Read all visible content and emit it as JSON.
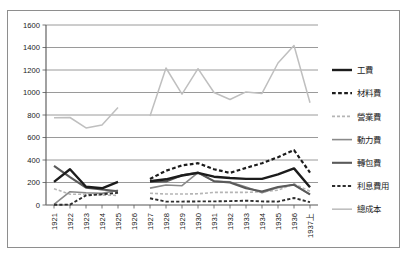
{
  "chart_data": {
    "type": "line",
    "title": "",
    "xlabel": "",
    "ylabel": "",
    "ylim": [
      0,
      1600
    ],
    "ytick_step": 200,
    "yticks": [
      0,
      200,
      400,
      600,
      800,
      1000,
      1200,
      1400,
      1600
    ],
    "grid": true,
    "legend_position": "right",
    "categories": [
      "1921",
      "1922",
      "1923",
      "1924",
      "1925",
      "1926",
      "1927",
      "1928",
      "1929",
      "1930",
      "1931",
      "1932",
      "1933",
      "1934",
      "1935",
      "1936",
      "1937上"
    ],
    "series": [
      {
        "name": "工費",
        "style": "solid",
        "color": "#1c1c1c",
        "width": 2.4,
        "values": [
          205,
          318,
          163,
          148,
          205,
          null,
          212,
          228,
          262,
          285,
          252,
          240,
          232,
          232,
          272,
          325,
          158
        ]
      },
      {
        "name": "材料費",
        "style": "dashed",
        "color": "#1c1c1c",
        "width": 2.2,
        "values": [
          null,
          null,
          null,
          null,
          null,
          null,
          232,
          305,
          352,
          372,
          318,
          285,
          330,
          372,
          425,
          488,
          288
        ]
      },
      {
        "name": "營業費",
        "style": "dashed-light",
        "color": "#b5b5b5",
        "width": 1.6,
        "values": [
          145,
          96,
          95,
          88,
          85,
          null,
          105,
          98,
          98,
          100,
          112,
          112,
          112,
          118,
          132,
          188,
          122
        ]
      },
      {
        "name": "動力費",
        "style": "solid",
        "color": "#8a8a8a",
        "width": 1.6,
        "values": [
          5,
          118,
          108,
          103,
          132,
          null,
          150,
          178,
          172,
          288,
          210,
          205,
          160,
          108,
          155,
          182,
          92
        ]
      },
      {
        "name": "轉包費",
        "style": "solid",
        "color": "#5a5a5a",
        "width": 2.1,
        "values": [
          348,
          248,
          155,
          138,
          122,
          null,
          205,
          210,
          265,
          288,
          212,
          200,
          148,
          120,
          160,
          180,
          95
        ]
      },
      {
        "name": "利息費用",
        "style": "dashed",
        "color": "#2e2e2e",
        "width": 1.9,
        "values": [
          2,
          4,
          85,
          95,
          108,
          null,
          60,
          30,
          30,
          32,
          32,
          35,
          38,
          32,
          30,
          62,
          25
        ]
      },
      {
        "name": "總成本",
        "style": "solid",
        "color": "#bfbfbf",
        "width": 1.5,
        "values": [
          775,
          778,
          685,
          712,
          868,
          null,
          792,
          1218,
          985,
          1212,
          1000,
          938,
          1005,
          992,
          1262,
          1418,
          908
        ]
      }
    ]
  },
  "axes": {
    "y_tick_labels": [
      "1600",
      "1400",
      "1200",
      "1000",
      "800",
      "600",
      "400",
      "200",
      "0"
    ],
    "x_tick_labels": [
      "1921",
      "1922",
      "1923",
      "1924",
      "1925",
      "1926",
      "1927",
      "1928",
      "1929",
      "1930",
      "1931",
      "1932",
      "1933",
      "1934",
      "1935",
      "1936",
      "1937上"
    ]
  },
  "legend": {
    "items": [
      {
        "label": "工費"
      },
      {
        "label": "材料費"
      },
      {
        "label": "營業費"
      },
      {
        "label": "動力費"
      },
      {
        "label": "轉包費"
      },
      {
        "label": "利息費用"
      },
      {
        "label": "總成本"
      }
    ]
  }
}
